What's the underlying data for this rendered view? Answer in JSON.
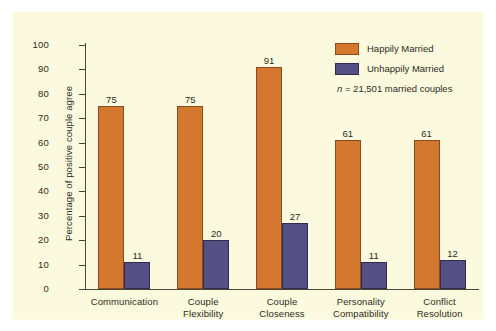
{
  "chart_data": {
    "type": "bar",
    "title": "",
    "subtitle": "",
    "xlabel": "",
    "ylabel": "Percentage of positive couple agree",
    "ylim": [
      0,
      100
    ],
    "ytick_step": 10,
    "yticks": [
      100,
      90,
      80,
      70,
      60,
      50,
      40,
      30,
      20,
      10,
      0
    ],
    "grid": false,
    "legend_position": "top-right",
    "annotation": "n = 21,501 married couples",
    "annotation_italic_prefix": "n",
    "annotation_rest": " = 21,501 married couples",
    "categories": [
      "Communication",
      "Couple Flexibility",
      "Couple Closeness",
      "Personality Compatibility",
      "Conflict Resolution"
    ],
    "category_lines": [
      [
        "Communication"
      ],
      [
        "Couple",
        "Flexibility"
      ],
      [
        "Couple",
        "Closeness"
      ],
      [
        "Personality",
        "Compatibility"
      ],
      [
        "Conflict",
        "Resolution"
      ]
    ],
    "series": [
      {
        "name": "Happily Married",
        "color": "#d4772f",
        "border_color": "#8c4a1d",
        "values": [
          75,
          75,
          91,
          61,
          61
        ]
      },
      {
        "name": "Unhappily Married",
        "color": "#545086",
        "border_color": "#2e2c50",
        "values": [
          11,
          20,
          27,
          11,
          12
        ]
      }
    ]
  },
  "colors": {
    "plate_background": "#fbfade",
    "page_background": "#ffffff",
    "axis": "#4a4636",
    "text": "#2e2b22",
    "happily_married": "#d4772f",
    "unhappily_married": "#545086"
  },
  "labels": {
    "y_axis_title": "Percentage of positive couple agree",
    "legend": [
      "Happily Married",
      "Unhappily Married"
    ],
    "sample_note": "n = 21,501 married couples",
    "value_labels_happy": [
      "75",
      "75",
      "91",
      "61",
      "61"
    ],
    "value_labels_unhappy": [
      "11",
      "20",
      "27",
      "11",
      "12"
    ],
    "ytick_labels": [
      "100",
      "90",
      "80",
      "70",
      "60",
      "50",
      "40",
      "30",
      "20",
      "10",
      "0"
    ]
  }
}
